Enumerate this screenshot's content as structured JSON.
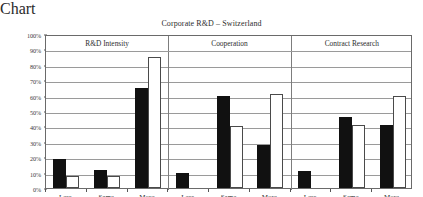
{
  "chart_data": {
    "type": "bar",
    "title": "Corporate R&D – Switzerland",
    "xlabel": "",
    "ylabel": "",
    "ylim": [
      0,
      100
    ],
    "ytick_labels": [
      "0%",
      "10%",
      "20%",
      "30%",
      "40%",
      "50%",
      "60%",
      "70%",
      "80%",
      "90%",
      "100%"
    ],
    "ytick_values": [
      0,
      10,
      20,
      30,
      40,
      50,
      60,
      70,
      80,
      90,
      100
    ],
    "grid": true,
    "legend": "none",
    "legend_entries": [],
    "group_labels": [
      "R&D Intensity",
      "Cooperation",
      "Contract Research"
    ],
    "categories": [
      "Less",
      "Same",
      "More",
      "Less",
      "Same",
      "More",
      "Less",
      "Same",
      "More"
    ],
    "series": [
      {
        "name": "black",
        "values": [
          19,
          12,
          65,
          10,
          60,
          28,
          11,
          46,
          41
        ]
      },
      {
        "name": "white",
        "values": [
          8,
          8,
          85,
          0,
          40,
          61,
          0,
          41,
          60
        ]
      }
    ],
    "groups": [
      {
        "label": "R&D Intensity",
        "categories": [
          "Less",
          "Same",
          "More"
        ],
        "black": [
          19,
          12,
          65
        ],
        "white": [
          8,
          8,
          85
        ]
      },
      {
        "label": "Cooperation",
        "categories": [
          "Less",
          "Same",
          "More"
        ],
        "black": [
          10,
          60,
          28
        ],
        "white": [
          0,
          40,
          61
        ]
      },
      {
        "label": "Contract Research",
        "categories": [
          "Less",
          "Same",
          "More"
        ],
        "black": [
          11,
          46,
          41
        ],
        "white": [
          0,
          41,
          60
        ]
      }
    ]
  },
  "colors": {
    "series_black": "#111111",
    "series_white": "#ffffff",
    "series_white_edge": "#4a4a4a",
    "gridline": "#9a9a9a",
    "frame": "#6a6a6a",
    "text": "#2e2e2e",
    "background": "#ffffff"
  }
}
